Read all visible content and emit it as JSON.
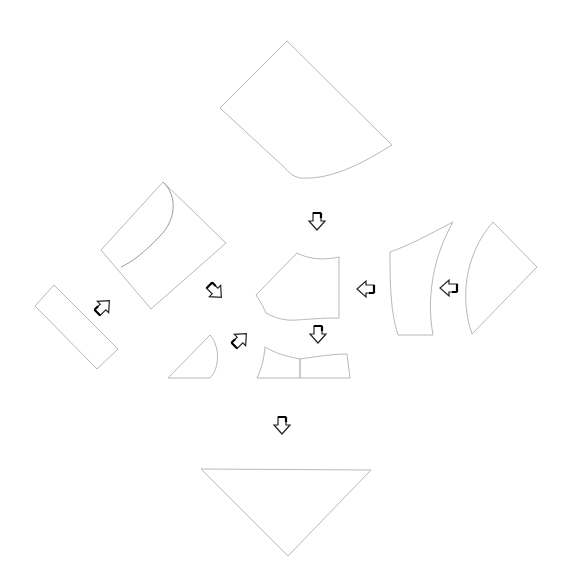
{
  "diagram": {
    "type": "pattern-pieces-assembly",
    "background": "#ffffff",
    "outline_color": "#b8b8b8",
    "arrow_color": "#222222",
    "pieces": [
      {
        "id": "top-panel",
        "shape": "quadrilateral-curved-bottom"
      },
      {
        "id": "left-square-with-flap",
        "shape": "rotated-square-with-inner-curve"
      },
      {
        "id": "center-bodice",
        "shape": "curved-pentagon"
      },
      {
        "id": "right-curved-panel",
        "shape": "curved-quadrilateral"
      },
      {
        "id": "far-right-wedge",
        "shape": "curved-triangle"
      },
      {
        "id": "left-strip",
        "shape": "rotated-rectangle"
      },
      {
        "id": "small-quarter-circle",
        "shape": "quarter-circle"
      },
      {
        "id": "split-band",
        "shape": "two-part-band"
      },
      {
        "id": "bottom-triangle",
        "shape": "inverted-triangle"
      }
    ],
    "arrows": [
      {
        "id": "arrow-top-down",
        "direction": "down"
      },
      {
        "id": "arrow-right-left",
        "direction": "left"
      },
      {
        "id": "arrow-far-right-left",
        "direction": "left"
      },
      {
        "id": "arrow-upper-left-diag",
        "direction": "down-right"
      },
      {
        "id": "arrow-left-strip-diag",
        "direction": "up-right"
      },
      {
        "id": "arrow-quarter-diag",
        "direction": "up-right"
      },
      {
        "id": "arrow-center-down",
        "direction": "down"
      },
      {
        "id": "arrow-bottom-down",
        "direction": "down"
      }
    ]
  }
}
